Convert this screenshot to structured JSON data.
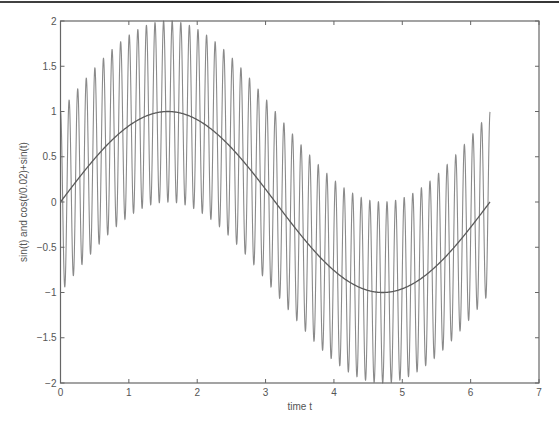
{
  "chart_data": {
    "type": "line",
    "title": "",
    "xlabel": "time t",
    "ylabel": "sin(t) and cos(t/0.02)+sin(t)",
    "xlim": [
      0,
      7
    ],
    "ylim": [
      -2,
      2
    ],
    "x_ticks": [
      0,
      1,
      2,
      3,
      4,
      5,
      6,
      7
    ],
    "x_tick_labels": [
      "0",
      "1",
      "2",
      "3",
      "4",
      "5",
      "6",
      "7"
    ],
    "y_ticks": [
      -2,
      -1.5,
      -1,
      -0.5,
      0,
      0.5,
      1,
      1.5,
      2
    ],
    "y_tick_labels": [
      "-2",
      "-1.5",
      "-1",
      "-0.5",
      "0",
      "0.5",
      "1",
      "1.5",
      "2"
    ],
    "grid": false,
    "legend": null,
    "x_range_data": [
      0,
      6.2832
    ],
    "series": [
      {
        "name": "sin(t)",
        "expression": "sin(t)",
        "color": "#5a5a5a",
        "x": [
          0,
          0.785,
          1.571,
          2.356,
          3.142,
          3.927,
          4.712,
          5.498,
          6.283
        ],
        "values": [
          0,
          0.707,
          1.0,
          0.707,
          0,
          -0.707,
          -1.0,
          -0.707,
          0
        ]
      },
      {
        "name": "cos(t/0.02)+sin(t)",
        "expression": "cos(t/0.02)+sin(t)",
        "color": "#8a8a8a",
        "period": 0.1257,
        "envelope_upper": [
          1,
          1.707,
          2.0,
          1.707,
          1,
          0.293,
          0,
          0.293,
          1
        ],
        "envelope_lower": [
          -1,
          -0.293,
          0,
          -0.293,
          -1,
          -1.707,
          -2.0,
          -1.707,
          -1
        ],
        "x": [
          0,
          0.785,
          1.571,
          2.356,
          3.142,
          3.927,
          4.712,
          5.498,
          6.283
        ]
      }
    ]
  },
  "colors": {
    "axis": "#666666",
    "background": "#ffffff",
    "text": "#555555"
  }
}
